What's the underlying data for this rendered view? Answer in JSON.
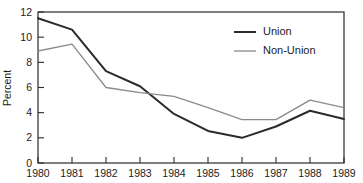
{
  "chart_data": {
    "type": "line",
    "title": "",
    "xlabel": "",
    "ylabel": "Percent",
    "x": [
      1980,
      1981,
      1982,
      1983,
      1984,
      1985,
      1986,
      1987,
      1988,
      1989
    ],
    "categories": [
      "1980",
      "1981",
      "1982",
      "1983",
      "1984",
      "1985",
      "1986",
      "1987",
      "1988",
      "1989"
    ],
    "series": [
      {
        "name": "Union",
        "color": "#2b2b2b",
        "line_width": 2.0,
        "values": [
          11.5,
          10.6,
          7.3,
          6.1,
          3.9,
          2.55,
          2.0,
          2.9,
          4.15,
          3.5
        ]
      },
      {
        "name": "Non-Union",
        "color": "#8a8a8a",
        "line_width": 1.3,
        "values": [
          8.9,
          9.45,
          6.0,
          5.6,
          5.3,
          4.4,
          3.45,
          3.45,
          5.0,
          4.4
        ]
      }
    ],
    "ylim": [
      0,
      12
    ],
    "ytick_values": [
      0,
      2,
      4,
      6,
      8,
      10,
      12
    ],
    "ytick_labels": [
      "0",
      "2",
      "4",
      "6",
      "8",
      "10",
      "12"
    ],
    "xlim": [
      1980,
      1989
    ],
    "xtick_labels": [
      "1980",
      "1981",
      "1982",
      "1983",
      "1984",
      "1985",
      "1986",
      "1987",
      "1988",
      "1989"
    ],
    "grid": false,
    "frame": true,
    "legend_position": "top-right",
    "legend": [
      "Union",
      "Non-Union"
    ]
  },
  "axes": {
    "y_title": "Percent"
  },
  "legend": {
    "items": [
      {
        "label": "Union"
      },
      {
        "label": "Non-Union"
      }
    ]
  }
}
